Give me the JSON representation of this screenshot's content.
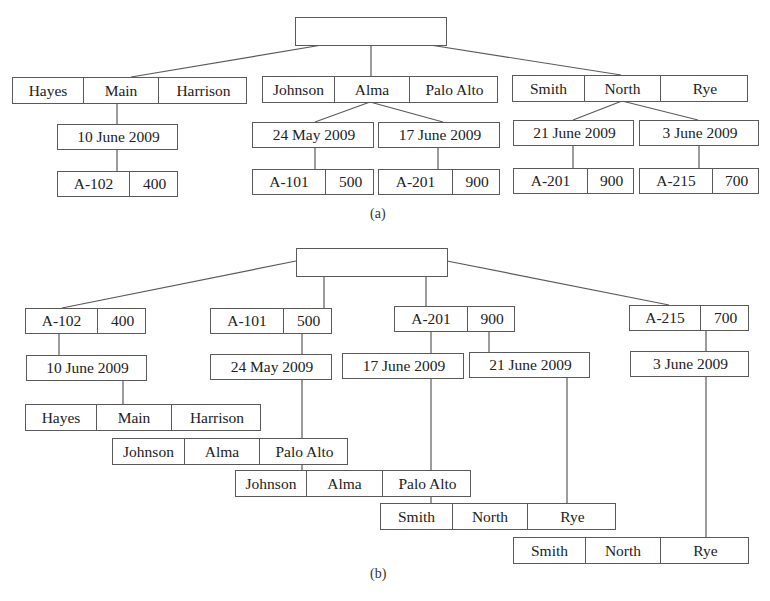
{
  "figure": {
    "parts": [
      {
        "id": "a",
        "caption": "(a)",
        "caption_pos": [
          370,
          206
        ],
        "nodes": [
          {
            "id": "a_root",
            "x": 295,
            "y": 17,
            "w": 152,
            "h": 29,
            "cells": [
              {
                "t": "",
                "w": 152
              }
            ]
          },
          {
            "id": "a_hayes",
            "x": 12,
            "y": 77,
            "w": 235,
            "h": 27,
            "cells": [
              {
                "t": "Hayes",
                "w": 70
              },
              {
                "t": "Main",
                "w": 75
              },
              {
                "t": "Harrison",
                "w": 90
              }
            ]
          },
          {
            "id": "a_johnson",
            "x": 262,
            "y": 76,
            "w": 236,
            "h": 27,
            "cells": [
              {
                "t": "Johnson",
                "w": 71
              },
              {
                "t": "Alma",
                "w": 75
              },
              {
                "t": "Palo Alto",
                "w": 90
              }
            ]
          },
          {
            "id": "a_smith",
            "x": 512,
            "y": 75,
            "w": 236,
            "h": 27,
            "cells": [
              {
                "t": "Smith",
                "w": 71
              },
              {
                "t": "North",
                "w": 76
              },
              {
                "t": "Rye",
                "w": 89
              }
            ]
          },
          {
            "id": "a_d10june",
            "x": 57,
            "y": 124,
            "w": 121,
            "h": 26,
            "cells": [
              {
                "t": "10 June 2009",
                "w": 121
              }
            ]
          },
          {
            "id": "a_d24may",
            "x": 252,
            "y": 122,
            "w": 122,
            "h": 26,
            "cells": [
              {
                "t": "24 May 2009",
                "w": 122
              }
            ]
          },
          {
            "id": "a_d17june",
            "x": 378,
            "y": 122,
            "w": 122,
            "h": 26,
            "cells": [
              {
                "t": "17 June 2009",
                "w": 122
              }
            ]
          },
          {
            "id": "a_d21june",
            "x": 513,
            "y": 120,
            "w": 121,
            "h": 26,
            "cells": [
              {
                "t": "21 June 2009",
                "w": 121
              }
            ]
          },
          {
            "id": "a_d3june",
            "x": 639,
            "y": 120,
            "w": 120,
            "h": 26,
            "cells": [
              {
                "t": "3 June 2009",
                "w": 120
              }
            ]
          },
          {
            "id": "a_a102",
            "x": 57,
            "y": 171,
            "w": 121,
            "h": 26,
            "cells": [
              {
                "t": "A-102",
                "w": 71
              },
              {
                "t": "400",
                "w": 50
              }
            ]
          },
          {
            "id": "a_a101",
            "x": 252,
            "y": 169,
            "w": 122,
            "h": 26,
            "cells": [
              {
                "t": "A-101",
                "w": 72
              },
              {
                "t": "500",
                "w": 50
              }
            ]
          },
          {
            "id": "a_a201",
            "x": 378,
            "y": 169,
            "w": 122,
            "h": 26,
            "cells": [
              {
                "t": "A-201",
                "w": 73
              },
              {
                "t": "900",
                "w": 49
              }
            ]
          },
          {
            "id": "a_a201b",
            "x": 513,
            "y": 168,
            "w": 121,
            "h": 26,
            "cells": [
              {
                "t": "A-201",
                "w": 73
              },
              {
                "t": "900",
                "w": 48
              }
            ]
          },
          {
            "id": "a_a215",
            "x": 639,
            "y": 168,
            "w": 120,
            "h": 26,
            "cells": [
              {
                "t": "A-215",
                "w": 72
              },
              {
                "t": "700",
                "w": 48
              }
            ]
          }
        ],
        "edges": [
          [
            322,
            45,
            131,
            77
          ],
          [
            371,
            45,
            371,
            76
          ],
          [
            430,
            45,
            621,
            75
          ],
          [
            117,
            103,
            117,
            124
          ],
          [
            117,
            149,
            117,
            171
          ],
          [
            370,
            102,
            315,
            122
          ],
          [
            370,
            102,
            443,
            122
          ],
          [
            315,
            148,
            315,
            169
          ],
          [
            438,
            148,
            438,
            169
          ],
          [
            622,
            101,
            573,
            120
          ],
          [
            622,
            101,
            698,
            120
          ],
          [
            573,
            146,
            573,
            168
          ],
          [
            699,
            146,
            699,
            168
          ]
        ]
      },
      {
        "id": "b",
        "caption": "(b)",
        "caption_pos": [
          370,
          566
        ],
        "nodes": [
          {
            "id": "b_root",
            "x": 296,
            "y": 248,
            "w": 152,
            "h": 29,
            "cells": [
              {
                "t": "",
                "w": 152
              }
            ]
          },
          {
            "id": "b_a102",
            "x": 25,
            "y": 308,
            "w": 121,
            "h": 26,
            "cells": [
              {
                "t": "A-102",
                "w": 71
              },
              {
                "t": "400",
                "w": 50
              }
            ]
          },
          {
            "id": "b_a101",
            "x": 210,
            "y": 308,
            "w": 122,
            "h": 26,
            "cells": [
              {
                "t": "A-101",
                "w": 72
              },
              {
                "t": "500",
                "w": 50
              }
            ]
          },
          {
            "id": "b_a201",
            "x": 394,
            "y": 306,
            "w": 121,
            "h": 26,
            "cells": [
              {
                "t": "A-201",
                "w": 72
              },
              {
                "t": "900",
                "w": 49
              }
            ]
          },
          {
            "id": "b_a215",
            "x": 629,
            "y": 305,
            "w": 120,
            "h": 26,
            "cells": [
              {
                "t": "A-215",
                "w": 70
              },
              {
                "t": "700",
                "w": 50
              }
            ]
          },
          {
            "id": "b_d10june",
            "x": 26,
            "y": 355,
            "w": 121,
            "h": 26,
            "cells": [
              {
                "t": "10 June 2009",
                "w": 121
              }
            ]
          },
          {
            "id": "b_d24may",
            "x": 210,
            "y": 354,
            "w": 122,
            "h": 26,
            "cells": [
              {
                "t": "24 May 2009",
                "w": 122
              }
            ]
          },
          {
            "id": "b_d17june",
            "x": 342,
            "y": 353,
            "w": 122,
            "h": 26,
            "cells": [
              {
                "t": "17 June 2009",
                "w": 122
              }
            ]
          },
          {
            "id": "b_d21june",
            "x": 469,
            "y": 352,
            "w": 121,
            "h": 26,
            "cells": [
              {
                "t": "21 June 2009",
                "w": 121
              }
            ]
          },
          {
            "id": "b_d3june",
            "x": 630,
            "y": 351,
            "w": 119,
            "h": 26,
            "cells": [
              {
                "t": "3 June 2009",
                "w": 119
              }
            ]
          },
          {
            "id": "b_hayes",
            "x": 25,
            "y": 404,
            "w": 236,
            "h": 27,
            "cells": [
              {
                "t": "Hayes",
                "w": 70
              },
              {
                "t": "Main",
                "w": 75
              },
              {
                "t": "Harrison",
                "w": 91
              }
            ]
          },
          {
            "id": "b_johnson1",
            "x": 112,
            "y": 438,
            "w": 236,
            "h": 27,
            "cells": [
              {
                "t": "Johnson",
                "w": 71
              },
              {
                "t": "Alma",
                "w": 75
              },
              {
                "t": "Palo Alto",
                "w": 90
              }
            ]
          },
          {
            "id": "b_johnson2",
            "x": 235,
            "y": 470,
            "w": 236,
            "h": 27,
            "cells": [
              {
                "t": "Johnson",
                "w": 70
              },
              {
                "t": "Alma",
                "w": 76
              },
              {
                "t": "Palo Alto",
                "w": 90
              }
            ]
          },
          {
            "id": "b_smith1",
            "x": 380,
            "y": 503,
            "w": 236,
            "h": 27,
            "cells": [
              {
                "t": "Smith",
                "w": 71
              },
              {
                "t": "North",
                "w": 75
              },
              {
                "t": "Rye",
                "w": 90
              }
            ]
          },
          {
            "id": "b_smith2",
            "x": 513,
            "y": 537,
            "w": 236,
            "h": 27,
            "cells": [
              {
                "t": "Smith",
                "w": 71
              },
              {
                "t": "North",
                "w": 75
              },
              {
                "t": "Rye",
                "w": 90
              }
            ]
          }
        ],
        "edges": [
          [
            296,
            261,
            62,
            308
          ],
          [
            324,
            276,
            324,
            308
          ],
          [
            426,
            276,
            426,
            306
          ],
          [
            447,
            261,
            669,
            305
          ],
          [
            59,
            334,
            59,
            355
          ],
          [
            123,
            380,
            123,
            404
          ],
          [
            302,
            333,
            302,
            354
          ],
          [
            302,
            379,
            302,
            470
          ],
          [
            431,
            331,
            431,
            353
          ],
          [
            489,
            331,
            489,
            352
          ],
          [
            431,
            378,
            431,
            503
          ],
          [
            567,
            377,
            567,
            503
          ],
          [
            706,
            330,
            706,
            351
          ],
          [
            706,
            376,
            706,
            537
          ]
        ]
      }
    ],
    "colors": {
      "line": "#5a5a5a",
      "text": "#222222",
      "background": "#ffffff"
    }
  }
}
